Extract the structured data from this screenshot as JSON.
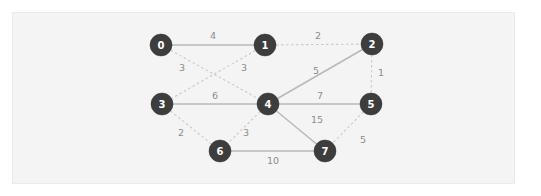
{
  "figure": {
    "kind": "weighted-undirected-graph",
    "watermark_text": "",
    "colors": {
      "page_background": "#ffffff",
      "card_background": "#f4f4f4",
      "card_border": "#ececec",
      "node_fill": "#3d3d3d",
      "node_text": "#ffffff",
      "edge_solid": "#b8b8b8",
      "edge_dashed": "#c9c9c9",
      "edge_label": "#8c8c8c"
    }
  },
  "graph": {
    "nodes": [
      {
        "id": "0",
        "label": "0",
        "x": 161,
        "y": 45,
        "r": 11
      },
      {
        "id": "1",
        "label": "1",
        "x": 265,
        "y": 45,
        "r": 11
      },
      {
        "id": "2",
        "label": "2",
        "x": 372,
        "y": 44,
        "r": 11
      },
      {
        "id": "3",
        "label": "3",
        "x": 162,
        "y": 104,
        "r": 11
      },
      {
        "id": "4",
        "label": "4",
        "x": 268,
        "y": 104,
        "r": 11
      },
      {
        "id": "5",
        "label": "5",
        "x": 371,
        "y": 104,
        "r": 11
      },
      {
        "id": "6",
        "label": "6",
        "x": 220,
        "y": 151,
        "r": 11
      },
      {
        "id": "7",
        "label": "7",
        "x": 325,
        "y": 151,
        "r": 11
      }
    ],
    "edges": [
      {
        "from": "0",
        "to": "1",
        "weight": "4",
        "style": "solid",
        "lx": 213,
        "ly": 36
      },
      {
        "from": "1",
        "to": "2",
        "weight": "2",
        "style": "dashed",
        "lx": 318,
        "ly": 36
      },
      {
        "from": "0",
        "to": "4",
        "weight": "3",
        "style": "dashed",
        "lx": 182,
        "ly": 68
      },
      {
        "from": "1",
        "to": "3",
        "weight": "3",
        "style": "dashed",
        "lx": 244,
        "ly": 68
      },
      {
        "from": "2",
        "to": "4",
        "weight": "5",
        "style": "solid",
        "lx": 316,
        "ly": 71
      },
      {
        "from": "2",
        "to": "5",
        "weight": "1",
        "style": "dashed",
        "lx": 381,
        "ly": 73
      },
      {
        "from": "3",
        "to": "4",
        "weight": "6",
        "style": "solid",
        "lx": 215,
        "ly": 96
      },
      {
        "from": "4",
        "to": "5",
        "weight": "7",
        "style": "solid",
        "lx": 320,
        "ly": 96
      },
      {
        "from": "3",
        "to": "6",
        "weight": "2",
        "style": "dashed",
        "lx": 181,
        "ly": 133
      },
      {
        "from": "4",
        "to": "6",
        "weight": "3",
        "style": "dashed",
        "lx": 246,
        "ly": 133
      },
      {
        "from": "4",
        "to": "7",
        "weight": "15",
        "style": "solid",
        "lx": 317,
        "ly": 120
      },
      {
        "from": "5",
        "to": "7",
        "weight": "5",
        "style": "dashed",
        "lx": 363,
        "ly": 140
      },
      {
        "from": "6",
        "to": "7",
        "weight": "10",
        "style": "solid",
        "lx": 273,
        "ly": 161
      }
    ]
  }
}
